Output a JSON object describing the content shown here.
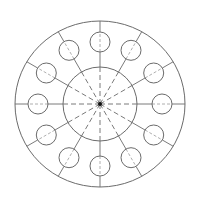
{
  "diagram": {
    "title": "",
    "type": "radial-hole-pattern",
    "colors": {
      "stroke": "#6b6b6b",
      "center": "#111111",
      "background": "#ffffff"
    },
    "center": {
      "x": 100,
      "y": 104
    },
    "outer_circle": {
      "rx": 85,
      "ry": 83
    },
    "inner_circle": {
      "r": 37
    },
    "small_circles": {
      "count": 12,
      "ring_radius": 62,
      "r": 10,
      "angle_step_deg": 30
    },
    "spokes": {
      "count": 12,
      "inner_style": "dashed",
      "outer_style": "solid"
    }
  }
}
